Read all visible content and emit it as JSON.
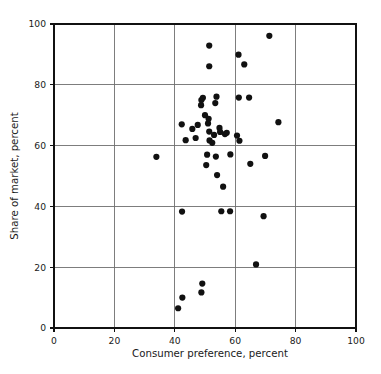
{
  "chart_data": {
    "type": "scatter",
    "title": "",
    "xlabel": "Consumer preference, percent",
    "ylabel": "Share of market, percent",
    "xlim": [
      0,
      100
    ],
    "ylim": [
      0,
      100
    ],
    "xticks": [
      0,
      20,
      40,
      60,
      80,
      100
    ],
    "yticks": [
      0,
      20,
      40,
      60,
      80,
      100
    ],
    "xticklabels": [
      "0",
      "20",
      "40",
      "60",
      "80",
      "100"
    ],
    "yticklabels": [
      "0",
      "20",
      "40",
      "60",
      "80",
      "100"
    ],
    "grid": true,
    "grid_color": "#6f6f6f",
    "legend": false,
    "marker_color": "#111111",
    "marker_size": 3.1,
    "frame_color": "#111111",
    "background": "#ffffff",
    "n_points": 49,
    "points": [
      {
        "x": 33.9,
        "y": 56.3
      },
      {
        "x": 41.1,
        "y": 6.5
      },
      {
        "x": 42.5,
        "y": 10.0
      },
      {
        "x": 42.4,
        "y": 38.3
      },
      {
        "x": 42.3,
        "y": 67.0
      },
      {
        "x": 43.6,
        "y": 61.8
      },
      {
        "x": 45.8,
        "y": 65.5
      },
      {
        "x": 46.9,
        "y": 62.5
      },
      {
        "x": 48.8,
        "y": 11.7
      },
      {
        "x": 49.1,
        "y": 14.6
      },
      {
        "x": 48.7,
        "y": 73.3
      },
      {
        "x": 48.8,
        "y": 75.0
      },
      {
        "x": 49.3,
        "y": 75.7
      },
      {
        "x": 50.4,
        "y": 53.6
      },
      {
        "x": 50.7,
        "y": 57.0
      },
      {
        "x": 51.0,
        "y": 67.3
      },
      {
        "x": 51.2,
        "y": 68.8
      },
      {
        "x": 51.4,
        "y": 64.6
      },
      {
        "x": 51.5,
        "y": 61.7
      },
      {
        "x": 51.4,
        "y": 92.9
      },
      {
        "x": 51.4,
        "y": 86.1
      },
      {
        "x": 53.0,
        "y": 63.5
      },
      {
        "x": 53.4,
        "y": 74.0
      },
      {
        "x": 53.8,
        "y": 76.1
      },
      {
        "x": 53.6,
        "y": 56.4
      },
      {
        "x": 54.0,
        "y": 50.3
      },
      {
        "x": 54.8,
        "y": 65.8
      },
      {
        "x": 55.0,
        "y": 64.5
      },
      {
        "x": 56.0,
        "y": 46.5
      },
      {
        "x": 55.4,
        "y": 38.4
      },
      {
        "x": 58.3,
        "y": 38.4
      },
      {
        "x": 58.4,
        "y": 57.1
      },
      {
        "x": 60.6,
        "y": 63.3
      },
      {
        "x": 61.1,
        "y": 89.9
      },
      {
        "x": 61.2,
        "y": 75.8
      },
      {
        "x": 61.4,
        "y": 61.6
      },
      {
        "x": 63.0,
        "y": 86.7
      },
      {
        "x": 64.6,
        "y": 75.8
      },
      {
        "x": 65.0,
        "y": 54.0
      },
      {
        "x": 66.9,
        "y": 20.9
      },
      {
        "x": 69.4,
        "y": 36.8
      },
      {
        "x": 69.9,
        "y": 56.6
      },
      {
        "x": 71.3,
        "y": 96.1
      },
      {
        "x": 74.3,
        "y": 67.7
      },
      {
        "x": 47.6,
        "y": 66.8
      },
      {
        "x": 56.6,
        "y": 63.8
      },
      {
        "x": 52.4,
        "y": 60.9
      },
      {
        "x": 57.2,
        "y": 64.2
      },
      {
        "x": 50.0,
        "y": 70.0
      }
    ]
  }
}
